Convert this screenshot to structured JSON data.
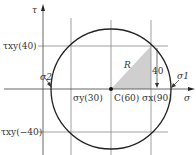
{
  "diagram": {
    "axes": {
      "vertical_label": "τ",
      "horizontal_label": "σ"
    },
    "labels": {
      "tau_xy_pos": "τxy(40)",
      "tau_xy_neg": "τxy(−40)",
      "sigma_y": "σy(30)",
      "center": "C(60)",
      "sigma_x": "σx(90)",
      "sigma_1": "σ1",
      "sigma_2": "σ2",
      "radius": "R",
      "height_40": "40"
    },
    "values": {
      "tau_xy": 40,
      "sigma_y": 30,
      "center": 60,
      "sigma_x": 90
    },
    "colors": {
      "line": "#222222",
      "grid": "#888888",
      "shade": "#c8c8c8"
    }
  }
}
